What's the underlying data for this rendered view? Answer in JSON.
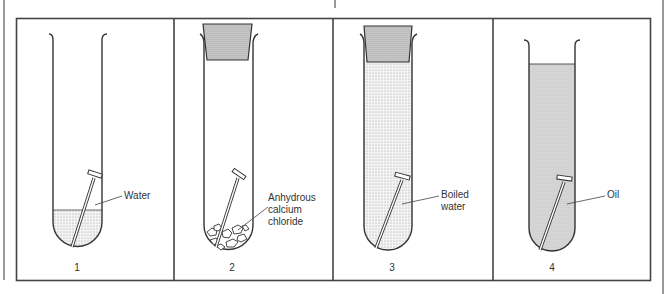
{
  "figure": {
    "panels": [
      {
        "number": "1",
        "label": "Water",
        "contents": "water",
        "stopper": false,
        "liquid_level": "low"
      },
      {
        "number": "2",
        "label": "Anhydrous calcium chloride",
        "label_lines": [
          "Anhydrous",
          "calcium",
          "chloride"
        ],
        "contents": "anhydrous calcium chloride",
        "stopper": true,
        "liquid_level": "none"
      },
      {
        "number": "3",
        "label": "Boiled water",
        "label_lines": [
          "Boiled",
          "water"
        ],
        "contents": "boiled water",
        "stopper": true,
        "liquid_level": "full"
      },
      {
        "number": "4",
        "label": "Oil",
        "contents": "oil",
        "stopper": false,
        "liquid_level": "high"
      }
    ]
  },
  "colors": {
    "line": "#333333",
    "fill_light": "#e6e6e6",
    "fill_dark": "#d4d4d4",
    "stopper": "#cfcfcf"
  }
}
